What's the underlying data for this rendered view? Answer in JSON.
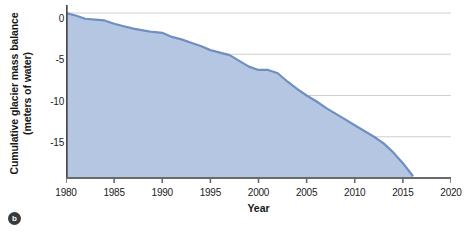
{
  "figure": {
    "badge_label": "b"
  },
  "chart_data": {
    "type": "area",
    "title": "",
    "xlabel": "Year",
    "ylabel": "Cumulative glacier mass balance (meters of water)",
    "ylabel_line1": "Cumulative glacier mass balance",
    "ylabel_line2": "(meters of water)",
    "xlim": [
      1980,
      2020
    ],
    "ylim": [
      -20,
      0
    ],
    "xticks": [
      1980,
      1985,
      1990,
      1995,
      2000,
      2005,
      2010,
      2015,
      2020
    ],
    "xticklabels": [
      "1980",
      "1985",
      "1990",
      "1995",
      "2000",
      "2005",
      "2010",
      "2015",
      "2020"
    ],
    "yticks": [
      0,
      -5,
      -10,
      -15
    ],
    "yticklabels": [
      "0",
      "-5",
      "-10",
      "-15"
    ],
    "grid": "horizontal",
    "legend": "none",
    "series_name": "Cumulative glacier mass balance",
    "line_color": "#6f8fc0",
    "fill_color": "#b4c6e2",
    "axis_color": "#555555",
    "grid_color": "#cfcfcf",
    "x": [
      1980,
      1981,
      1982,
      1983,
      1984,
      1985,
      1986,
      1987,
      1988,
      1989,
      1990,
      1991,
      1992,
      1993,
      1994,
      1995,
      1996,
      1997,
      1998,
      1999,
      2000,
      2001,
      2002,
      2003,
      2004,
      2005,
      2006,
      2007,
      2008,
      2009,
      2010,
      2011,
      2012,
      2013,
      2014,
      2015,
      2016
    ],
    "values": [
      0.0,
      -0.3,
      -0.7,
      -0.8,
      -0.9,
      -1.3,
      -1.6,
      -1.9,
      -2.1,
      -2.3,
      -2.4,
      -2.9,
      -3.2,
      -3.6,
      -4.0,
      -4.5,
      -4.8,
      -5.1,
      -5.8,
      -6.5,
      -6.9,
      -6.9,
      -7.3,
      -8.3,
      -9.2,
      -10.0,
      -10.7,
      -11.5,
      -12.2,
      -12.9,
      -13.6,
      -14.3,
      -15.0,
      -15.8,
      -16.9,
      -18.2,
      -19.7
    ],
    "ylabel_units": "meters of water"
  }
}
